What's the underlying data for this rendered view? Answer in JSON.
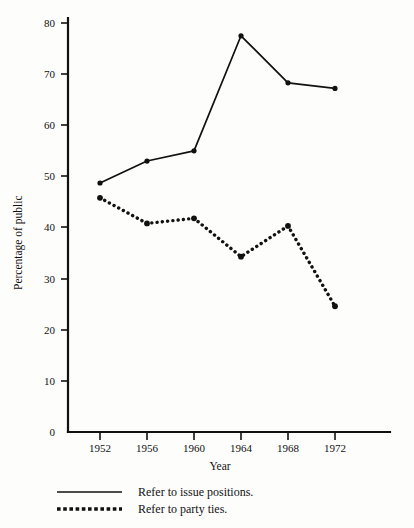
{
  "chart_data": {
    "type": "line",
    "title": "",
    "xlabel": "Year",
    "ylabel": "Percentage of public",
    "categories": [
      "1952",
      "1956",
      "1960",
      "1964",
      "1968",
      "1972"
    ],
    "x": [
      1952,
      1956,
      1960,
      1964,
      1968,
      1972
    ],
    "xlim": [
      1950,
      1976
    ],
    "ylim": [
      0,
      82
    ],
    "ytick_labels": [
      "0",
      "10",
      "20",
      "30",
      "40",
      "50",
      "60",
      "70",
      "80"
    ],
    "yticks": [
      0,
      10,
      20,
      30,
      40,
      50,
      60,
      70,
      80
    ],
    "xtick_labels": [
      "1952",
      "1956",
      "1960",
      "1964",
      "1968",
      "1972"
    ],
    "grid": false,
    "legend_position": "below-plot-left",
    "series": [
      {
        "name": "Refer to issue positions.",
        "style": "solid",
        "marker": "filled-circle",
        "color": "#111111",
        "values": [
          48.7,
          53.0,
          55.0,
          77.5,
          68.3,
          67.2
        ]
      },
      {
        "name": "Refer to party ties.",
        "style": "dotted",
        "marker": "filled-circle",
        "color": "#111111",
        "values": [
          45.8,
          40.8,
          41.8,
          34.3,
          40.3,
          24.6
        ]
      }
    ]
  },
  "axes": {
    "y_title": "Percentage of public",
    "x_title": "Year"
  },
  "legend": {
    "entries": [
      {
        "label": "Refer to issue positions.",
        "swatch": "solid-line-swatch"
      },
      {
        "label": "Refer to party ties.",
        "swatch": "dotted-line-swatch"
      }
    ]
  },
  "ytick_texts": {
    "t0": "0",
    "t1": "10",
    "t2": "20",
    "t3": "30",
    "t4": "40",
    "t5": "50",
    "t6": "60",
    "t7": "70",
    "t8": "80"
  },
  "xtick_texts": {
    "t0": "1952",
    "t1": "1956",
    "t2": "1960",
    "t3": "1964",
    "t4": "1968",
    "t5": "1972"
  }
}
